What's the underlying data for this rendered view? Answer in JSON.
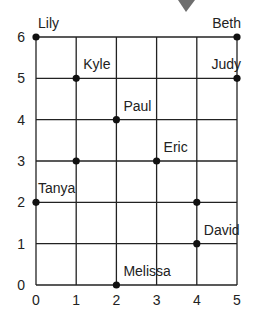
{
  "chart_data": {
    "type": "scatter",
    "title": "",
    "xlabel": "",
    "ylabel": "",
    "xlim": [
      0,
      5
    ],
    "ylim": [
      0,
      6
    ],
    "grid": true,
    "x_ticks": [
      "0",
      "1",
      "2",
      "3",
      "4",
      "5"
    ],
    "y_ticks": [
      "0",
      "1",
      "2",
      "3",
      "4",
      "5",
      "6"
    ],
    "points": [
      {
        "name": "Lily",
        "x": 0,
        "y": 6
      },
      {
        "name": "Beth",
        "x": 5,
        "y": 6
      },
      {
        "name": "Kyle",
        "x": 1,
        "y": 5
      },
      {
        "name": "Judy",
        "x": 5,
        "y": 5
      },
      {
        "name": "Paul",
        "x": 2,
        "y": 4
      },
      {
        "name": "",
        "x": 1,
        "y": 3
      },
      {
        "name": "Eric",
        "x": 3,
        "y": 3
      },
      {
        "name": "Tanya",
        "x": 0,
        "y": 2
      },
      {
        "name": "",
        "x": 4,
        "y": 2
      },
      {
        "name": "David",
        "x": 4,
        "y": 1
      },
      {
        "name": "Melissa",
        "x": 2,
        "y": 0
      }
    ],
    "colors": {
      "grid": "#222222",
      "point": "#111111",
      "marker_top": "#6e6e6e"
    }
  }
}
